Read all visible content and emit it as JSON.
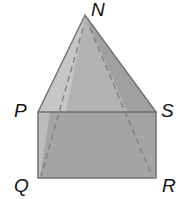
{
  "figure": {
    "vertices": {
      "N": "N",
      "P": "P",
      "S": "S",
      "Q": "Q",
      "R": "R"
    },
    "colors": {
      "face_front": "#a8a8a8",
      "face_left": "#c4c4c4",
      "face_right": "#9c9c9c",
      "rect": "#a2a2a2",
      "rect_left": "#bdbdbd",
      "edge": "#6e6e6e",
      "dashed": "#7a7a7a"
    }
  }
}
